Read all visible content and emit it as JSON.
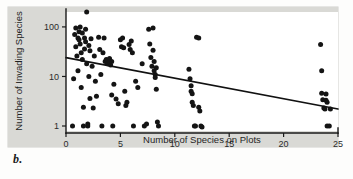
{
  "figure": {
    "caption": "b."
  },
  "chart_data": {
    "type": "scatter",
    "title": "",
    "xlabel": "Number of Species on Plots",
    "ylabel": "Number of Invading Species",
    "xlim": [
      0,
      25
    ],
    "ylim": [
      1,
      200
    ],
    "yscale": "log",
    "xscale": "linear",
    "grid": false,
    "legend": null,
    "xticks": [
      0,
      5,
      10,
      15,
      20,
      25
    ],
    "xtick_labels": [
      "0",
      "5",
      "10",
      "15",
      "20",
      "25"
    ],
    "yticks": [
      1,
      10,
      100
    ],
    "ytick_labels": [
      "1",
      "10",
      "100"
    ],
    "marker": "filled-circle",
    "marker_color": "#141414",
    "trendline": {
      "type": "linear-on-log-y",
      "color": "#111111",
      "x_start": 0,
      "y_start": 24,
      "x_end": 25,
      "y_end": 2.2,
      "direction": "negative"
    },
    "n_points": 112,
    "points": [
      [
        0.6,
        1.0
      ],
      [
        0.7,
        9.0
      ],
      [
        0.8,
        70.0
      ],
      [
        0.9,
        95.0
      ],
      [
        0.9,
        40.0
      ],
      [
        1.0,
        26.0
      ],
      [
        1.1,
        60.0
      ],
      [
        1.1,
        13.0
      ],
      [
        1.2,
        80.0
      ],
      [
        1.2,
        55.0
      ],
      [
        1.3,
        100.0
      ],
      [
        1.3,
        45.0
      ],
      [
        1.4,
        30.0
      ],
      [
        1.4,
        6.0
      ],
      [
        1.5,
        75.0
      ],
      [
        1.5,
        22.0
      ],
      [
        1.6,
        1.0
      ],
      [
        1.6,
        2.4
      ],
      [
        1.7,
        60.0
      ],
      [
        1.7,
        36.0
      ],
      [
        1.8,
        90.0
      ],
      [
        1.8,
        50.0
      ],
      [
        1.9,
        200.0
      ],
      [
        1.9,
        18.0
      ],
      [
        2.0,
        1.1
      ],
      [
        2.0,
        1.0
      ],
      [
        2.1,
        42.0
      ],
      [
        2.1,
        10.0
      ],
      [
        2.2,
        33.0
      ],
      [
        2.2,
        3.6
      ],
      [
        2.3,
        58.0
      ],
      [
        2.4,
        16.0
      ],
      [
        2.5,
        2.3
      ],
      [
        2.6,
        26.0
      ],
      [
        2.7,
        8.0
      ],
      [
        2.8,
        4.0
      ],
      [
        3.0,
        62.0
      ],
      [
        3.1,
        35.0
      ],
      [
        3.2,
        11.0
      ],
      [
        3.3,
        1.0
      ],
      [
        3.4,
        30.0
      ],
      [
        3.5,
        60.0
      ],
      [
        3.6,
        20.0
      ],
      [
        3.7,
        22.0
      ],
      [
        3.8,
        18.0
      ],
      [
        3.9,
        21.0
      ],
      [
        4.0,
        19.0
      ],
      [
        4.0,
        23.0
      ],
      [
        4.1,
        17.0
      ],
      [
        4.2,
        20.0
      ],
      [
        4.2,
        4.2
      ],
      [
        4.3,
        1.0
      ],
      [
        4.4,
        7.0
      ],
      [
        4.6,
        3.5
      ],
      [
        4.8,
        2.8
      ],
      [
        5.0,
        55.0
      ],
      [
        5.1,
        40.0
      ],
      [
        5.2,
        60.0
      ],
      [
        5.3,
        38.0
      ],
      [
        5.4,
        5.0
      ],
      [
        5.5,
        2.6
      ],
      [
        5.6,
        3.0
      ],
      [
        5.8,
        44.0
      ],
      [
        5.9,
        35.0
      ],
      [
        6.0,
        52.0
      ],
      [
        6.1,
        30.0
      ],
      [
        6.2,
        1.0
      ],
      [
        6.4,
        8.0
      ],
      [
        6.6,
        6.0
      ],
      [
        7.0,
        18.0
      ],
      [
        7.2,
        1.0
      ],
      [
        7.4,
        1.1
      ],
      [
        7.6,
        90.0
      ],
      [
        7.7,
        45.0
      ],
      [
        7.8,
        24.0
      ],
      [
        7.9,
        16.0
      ],
      [
        8.0,
        95.0
      ],
      [
        8.0,
        34.0
      ],
      [
        8.1,
        20.0
      ],
      [
        8.1,
        13.0
      ],
      [
        8.2,
        11.0
      ],
      [
        8.2,
        9.5
      ],
      [
        8.3,
        15.0
      ],
      [
        8.3,
        5.5
      ],
      [
        8.4,
        1.2
      ],
      [
        8.5,
        1.0
      ],
      [
        11.3,
        14.0
      ],
      [
        11.4,
        9.0
      ],
      [
        11.5,
        6.5
      ],
      [
        11.5,
        5.0
      ],
      [
        11.6,
        4.5
      ],
      [
        11.6,
        3.0
      ],
      [
        11.7,
        2.6
      ],
      [
        11.8,
        1.0
      ],
      [
        11.9,
        1.0
      ],
      [
        12.0,
        62.0
      ],
      [
        12.2,
        60.0
      ],
      [
        12.2,
        2.4
      ],
      [
        12.3,
        2.0
      ],
      [
        12.4,
        1.0
      ],
      [
        12.5,
        0.95
      ],
      [
        23.4,
        44.0
      ],
      [
        23.5,
        13.0
      ],
      [
        23.5,
        4.6
      ],
      [
        23.6,
        3.4
      ],
      [
        23.7,
        2.3
      ],
      [
        23.8,
        2.2
      ],
      [
        23.9,
        4.4
      ],
      [
        23.9,
        3.3
      ],
      [
        24.0,
        3.0
      ],
      [
        24.0,
        1.0
      ],
      [
        24.2,
        1.0
      ],
      [
        24.3,
        2.2
      ]
    ]
  }
}
